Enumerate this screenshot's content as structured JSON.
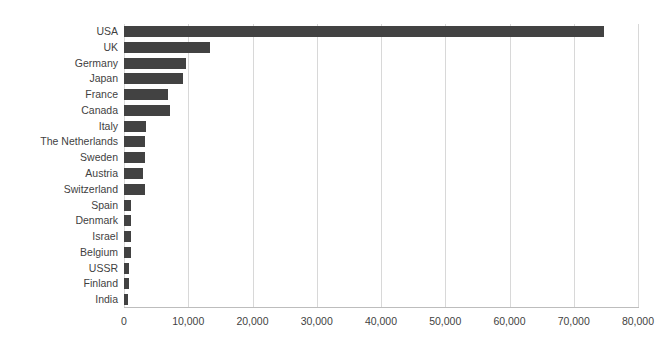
{
  "chart_data": {
    "type": "bar",
    "orientation": "horizontal",
    "title": "",
    "xlabel": "",
    "ylabel": "",
    "xlim": [
      0,
      80000
    ],
    "xticks": [
      0,
      10000,
      20000,
      30000,
      40000,
      50000,
      60000,
      70000,
      80000
    ],
    "xtick_labels": [
      "0",
      "10,000",
      "20,000",
      "30,000",
      "40,000",
      "50,000",
      "60,000",
      "70,000",
      "80,000"
    ],
    "grid": "vertical",
    "legend": "none",
    "bar_color": "#424242",
    "gridline_color": "#d8d8d8",
    "axis_color": "#bdbdbd",
    "categories": [
      "USA",
      "UK",
      "Germany",
      "Japan",
      "France",
      "Canada",
      "Italy",
      "The Netherlands",
      "Sweden",
      "Austria",
      "Switzerland",
      "Spain",
      "Denmark",
      "Israel",
      "Belgium",
      "USSR",
      "Finland",
      "India"
    ],
    "values": [
      74700,
      13400,
      9650,
      9200,
      6850,
      7200,
      3400,
      3300,
      3200,
      3000,
      3200,
      1150,
      1150,
      1100,
      1100,
      800,
      800,
      650
    ]
  }
}
